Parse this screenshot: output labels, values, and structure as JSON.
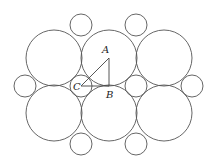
{
  "diagram": {
    "large_circle_radius": 28,
    "small_circle_radius": 11,
    "large_circles": [
      {
        "cx": 54,
        "cy": 58
      },
      {
        "cx": 109,
        "cy": 58
      },
      {
        "cx": 164,
        "cy": 58
      },
      {
        "cx": 54,
        "cy": 113
      },
      {
        "cx": 109,
        "cy": 113
      },
      {
        "cx": 164,
        "cy": 113
      }
    ],
    "small_circles": [
      {
        "cx": 81,
        "cy": 25
      },
      {
        "cx": 136,
        "cy": 25
      },
      {
        "cx": 25,
        "cy": 86
      },
      {
        "cx": 81,
        "cy": 86
      },
      {
        "cx": 136,
        "cy": 86
      },
      {
        "cx": 192,
        "cy": 86
      },
      {
        "cx": 81,
        "cy": 144
      },
      {
        "cx": 136,
        "cy": 144
      }
    ],
    "points": {
      "A": {
        "label": "A",
        "x": 109,
        "y": 58
      },
      "B": {
        "label": "B",
        "x": 109,
        "y": 86
      },
      "C": {
        "label": "C",
        "x": 81,
        "y": 86
      }
    }
  }
}
